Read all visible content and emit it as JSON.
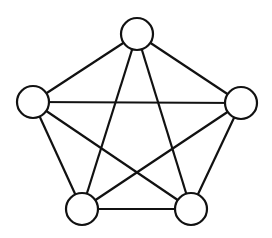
{
  "diagram": {
    "type": "graph",
    "name": "complete graph K5",
    "width": 272,
    "height": 238,
    "stroke_color": "#111111",
    "fill_color": "#ffffff",
    "stroke_width": 2.2,
    "node_radius": 16,
    "nodes": [
      {
        "id": "top",
        "x": 137,
        "y": 34
      },
      {
        "id": "left",
        "x": 33,
        "y": 102
      },
      {
        "id": "right",
        "x": 241,
        "y": 103
      },
      {
        "id": "bottom-left",
        "x": 82,
        "y": 209
      },
      {
        "id": "bottom-right",
        "x": 191,
        "y": 209
      }
    ],
    "edges": [
      [
        "top",
        "left"
      ],
      [
        "top",
        "right"
      ],
      [
        "top",
        "bottom-left"
      ],
      [
        "top",
        "bottom-right"
      ],
      [
        "left",
        "right"
      ],
      [
        "left",
        "bottom-left"
      ],
      [
        "left",
        "bottom-right"
      ],
      [
        "right",
        "bottom-left"
      ],
      [
        "right",
        "bottom-right"
      ],
      [
        "bottom-left",
        "bottom-right"
      ]
    ]
  }
}
